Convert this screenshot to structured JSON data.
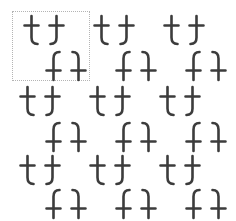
{
  "figure": {
    "background_color": "#ffffff",
    "glyph_color": "#3c3c3c",
    "marker_color": "#b4b4b4",
    "width": 236,
    "height": 221
  },
  "unit_cell": {
    "label": "repeating unit cell",
    "style": "dotted rectangle",
    "x": 12,
    "y": 11,
    "width": 78,
    "height": 70
  },
  "glyph_set": {
    "base_character": "t",
    "orientations": [
      {
        "id": "identity",
        "name": "upright t",
        "transform": "none"
      },
      {
        "id": "mirror-h",
        "name": "horizontally mirrored t",
        "transform": "scaleX(-1)"
      },
      {
        "id": "mirror-v",
        "name": "vertically mirrored t",
        "transform": "scaleY(-1)"
      },
      {
        "id": "rotate-180",
        "name": "rotated 180 degrees t",
        "transform": "scale(-1,-1)"
      }
    ]
  },
  "lattice": {
    "rows": 6,
    "columns": 6,
    "column_step": 36,
    "row_step": 34,
    "odd_row_offset": 0,
    "even_row_offset": 18,
    "origin_x": 18,
    "origin_y": 14
  },
  "glyphs": [
    {
      "row": 0,
      "col": 0,
      "x": 18,
      "y": 14,
      "orientation": "identity"
    },
    {
      "row": 0,
      "col": 1,
      "x": 44,
      "y": 14,
      "orientation": "mirror-h"
    },
    {
      "row": 0,
      "col": 2,
      "x": 88,
      "y": 14,
      "orientation": "identity"
    },
    {
      "row": 0,
      "col": 3,
      "x": 114,
      "y": 14,
      "orientation": "mirror-h"
    },
    {
      "row": 0,
      "col": 4,
      "x": 158,
      "y": 14,
      "orientation": "identity"
    },
    {
      "row": 0,
      "col": 5,
      "x": 184,
      "y": 14,
      "orientation": "mirror-h"
    },
    {
      "row": 1,
      "col": 0,
      "x": 40,
      "y": 48,
      "orientation": "mirror-v"
    },
    {
      "row": 1,
      "col": 1,
      "x": 66,
      "y": 48,
      "orientation": "rotate-180"
    },
    {
      "row": 1,
      "col": 2,
      "x": 110,
      "y": 48,
      "orientation": "mirror-v"
    },
    {
      "row": 1,
      "col": 3,
      "x": 136,
      "y": 48,
      "orientation": "rotate-180"
    },
    {
      "row": 1,
      "col": 4,
      "x": 180,
      "y": 48,
      "orientation": "mirror-v"
    },
    {
      "row": 1,
      "col": 5,
      "x": 206,
      "y": 48,
      "orientation": "rotate-180"
    },
    {
      "row": 2,
      "col": 0,
      "x": 14,
      "y": 85,
      "orientation": "identity"
    },
    {
      "row": 2,
      "col": 1,
      "x": 40,
      "y": 85,
      "orientation": "mirror-h"
    },
    {
      "row": 2,
      "col": 2,
      "x": 84,
      "y": 85,
      "orientation": "identity"
    },
    {
      "row": 2,
      "col": 3,
      "x": 110,
      "y": 85,
      "orientation": "mirror-h"
    },
    {
      "row": 2,
      "col": 4,
      "x": 154,
      "y": 85,
      "orientation": "identity"
    },
    {
      "row": 2,
      "col": 5,
      "x": 180,
      "y": 85,
      "orientation": "mirror-h"
    },
    {
      "row": 3,
      "col": 0,
      "x": 40,
      "y": 119,
      "orientation": "mirror-v"
    },
    {
      "row": 3,
      "col": 1,
      "x": 66,
      "y": 119,
      "orientation": "rotate-180"
    },
    {
      "row": 3,
      "col": 2,
      "x": 110,
      "y": 119,
      "orientation": "mirror-v"
    },
    {
      "row": 3,
      "col": 3,
      "x": 136,
      "y": 119,
      "orientation": "rotate-180"
    },
    {
      "row": 3,
      "col": 4,
      "x": 180,
      "y": 119,
      "orientation": "mirror-v"
    },
    {
      "row": 3,
      "col": 5,
      "x": 206,
      "y": 119,
      "orientation": "rotate-180"
    },
    {
      "row": 4,
      "col": 0,
      "x": 14,
      "y": 154,
      "orientation": "identity"
    },
    {
      "row": 4,
      "col": 1,
      "x": 40,
      "y": 154,
      "orientation": "mirror-h"
    },
    {
      "row": 4,
      "col": 2,
      "x": 84,
      "y": 154,
      "orientation": "identity"
    },
    {
      "row": 4,
      "col": 3,
      "x": 110,
      "y": 154,
      "orientation": "mirror-h"
    },
    {
      "row": 4,
      "col": 4,
      "x": 154,
      "y": 154,
      "orientation": "identity"
    },
    {
      "row": 4,
      "col": 5,
      "x": 180,
      "y": 154,
      "orientation": "mirror-h"
    },
    {
      "row": 5,
      "col": 0,
      "x": 40,
      "y": 186,
      "orientation": "mirror-v"
    },
    {
      "row": 5,
      "col": 1,
      "x": 66,
      "y": 186,
      "orientation": "rotate-180"
    },
    {
      "row": 5,
      "col": 2,
      "x": 110,
      "y": 186,
      "orientation": "mirror-v"
    },
    {
      "row": 5,
      "col": 3,
      "x": 136,
      "y": 186,
      "orientation": "rotate-180"
    },
    {
      "row": 5,
      "col": 4,
      "x": 180,
      "y": 186,
      "orientation": "mirror-v"
    },
    {
      "row": 5,
      "col": 5,
      "x": 206,
      "y": 186,
      "orientation": "rotate-180"
    }
  ]
}
